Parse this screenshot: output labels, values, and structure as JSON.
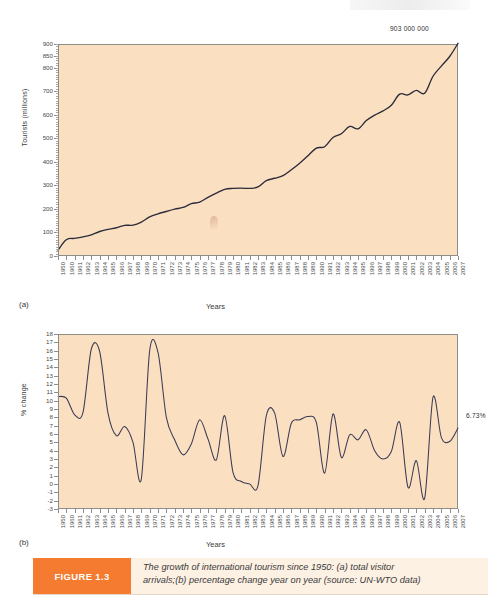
{
  "caption": {
    "badge": "FIGURE 1.3",
    "line1": "The growth of international tourism since 1950: (a) total visitor",
    "line2": "arrivals;(b) percentage change year on year (source: UN-WTO data)"
  },
  "colors": {
    "plot_background": "#fae0c0",
    "line_a": "#2b2b3c",
    "line_b": "#3b3b57",
    "axis": "#8e8d88",
    "badge_orange": "#f47b30",
    "caption_background": "#fdf1e4"
  },
  "panels": {
    "a": {
      "letter": "(a)"
    },
    "b": {
      "letter": "(b)"
    }
  },
  "chart_data": [
    {
      "id": "a",
      "type": "line",
      "title": "",
      "panel_label": "(a)",
      "xlabel": "Years",
      "ylabel": "Tourists (millions)",
      "ylim": [
        0,
        900
      ],
      "yticks": [
        0,
        100,
        200,
        300,
        400,
        500,
        600,
        700,
        800,
        850,
        900
      ],
      "ytick_labels": [
        "0",
        "100",
        "200",
        "300",
        "400",
        "500",
        "600",
        "700",
        "800",
        "850",
        "900"
      ],
      "grid": false,
      "legend": "none",
      "annotations": [
        {
          "text": "903 000 000",
          "at_x": "2007",
          "at_y": 903
        }
      ],
      "categories": [
        "1950",
        "1960",
        "1961",
        "1962",
        "1963",
        "1964",
        "1965",
        "1966",
        "1967",
        "1968",
        "1969",
        "1970",
        "1971",
        "1972",
        "1973",
        "1974",
        "1975",
        "1976",
        "1977",
        "1978",
        "1979",
        "1980",
        "1981",
        "1982",
        "1983",
        "1984",
        "1985",
        "1986",
        "1987",
        "1988",
        "1989",
        "1990",
        "1991",
        "1992",
        "1993",
        "1994",
        "1995",
        "1996",
        "1997",
        "1998",
        "1999",
        "2000",
        "2001",
        "2002",
        "2003",
        "2004",
        "2005",
        "2006",
        "2007"
      ],
      "values": [
        25,
        69,
        75,
        81,
        90,
        104,
        113,
        120,
        130,
        131,
        144,
        166,
        179,
        189,
        199,
        206,
        222,
        229,
        249,
        267,
        283,
        287,
        288,
        287,
        293,
        320,
        330,
        341,
        366,
        394,
        426,
        458,
        464,
        503,
        519,
        550,
        540,
        575,
        598,
        616,
        640,
        687,
        684,
        703,
        691,
        763,
        806,
        847,
        903
      ]
    },
    {
      "id": "b",
      "type": "line",
      "title": "",
      "panel_label": "(b)",
      "xlabel": "Years",
      "ylabel": "% change",
      "ylim": [
        -3,
        18
      ],
      "yticks": [
        -3,
        -2,
        -1,
        0,
        1,
        2,
        3,
        4,
        5,
        6,
        7,
        8,
        9,
        10,
        11,
        12,
        13,
        14,
        15,
        16,
        17,
        18
      ],
      "ytick_labels": [
        "-3",
        "-2",
        "-1",
        "0",
        "1",
        "2",
        "3",
        "4",
        "5",
        "6",
        "7",
        "8",
        "9",
        "10",
        "11",
        "12",
        "13",
        "14",
        "15",
        "16",
        "17",
        "18"
      ],
      "grid": false,
      "legend": "none",
      "annotations": [
        {
          "text": "6.73%",
          "at_x": "2007",
          "at_y": 6.73
        }
      ],
      "categories": [
        "1950",
        "1960",
        "1961",
        "1962",
        "1963",
        "1964",
        "1965",
        "1966",
        "1967",
        "1968",
        "1969",
        "1970",
        "1971",
        "1972",
        "1973",
        "1974",
        "1975",
        "1976",
        "1977",
        "1978",
        "1979",
        "1980",
        "1981",
        "1982",
        "1983",
        "1984",
        "1985",
        "1986",
        "1987",
        "1988",
        "1989",
        "1990",
        "1991",
        "1992",
        "1993",
        "1994",
        "1995",
        "1996",
        "1997",
        "1998",
        "1999",
        "2000",
        "2001",
        "2002",
        "2003",
        "2004",
        "2005",
        "2006",
        "2007"
      ],
      "values": [
        10.5,
        10.3,
        8.3,
        8.6,
        16.2,
        15.9,
        8.5,
        5.8,
        6.9,
        5.0,
        0.6,
        16.0,
        15.8,
        8.0,
        5.3,
        3.5,
        4.8,
        7.7,
        5.4,
        2.9,
        8.2,
        1.4,
        0.3,
        0.0,
        -0.2,
        8.2,
        8.5,
        3.3,
        7.3,
        7.7,
        8.1,
        7.4,
        1.3,
        8.4,
        3.2,
        5.9,
        5.3,
        6.5,
        4.0,
        3.0,
        3.9,
        7.4,
        -0.4,
        2.8,
        -1.7,
        10.4,
        5.6,
        5.1,
        6.73
      ]
    }
  ]
}
